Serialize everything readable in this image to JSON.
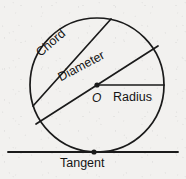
{
  "diagram": {
    "background_color": "#f2f1ef",
    "stroke_color": "#1a1a1a",
    "labels": {
      "chord": "Chord",
      "diameter": "Diameter",
      "radius": "Radius",
      "center": "O",
      "tangent": "Tangent"
    },
    "geometry": {
      "circle": {
        "cx": 97,
        "cy": 85,
        "r": 67
      },
      "chord": {
        "x1": 33,
        "y1": 106,
        "x2": 111,
        "y2": 19
      },
      "diameter": {
        "x1": 36,
        "y1": 124,
        "x2": 158,
        "y2": 46
      },
      "radius": {
        "x1": 97,
        "y1": 85,
        "x2": 164,
        "y2": 85
      },
      "tangent_line": {
        "x1": 8,
        "y1": 152,
        "x2": 178,
        "y2": 152
      },
      "center_point": {
        "x": 97,
        "y": 85
      },
      "tangency_point": {
        "x": 94,
        "y": 152
      }
    }
  }
}
